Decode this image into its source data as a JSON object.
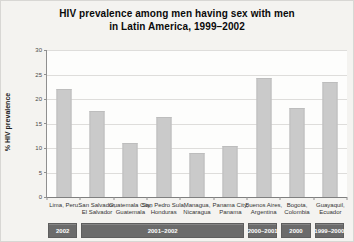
{
  "title": {
    "line1": "HIV prevalence among men having sex with men",
    "line2": "in Latin America, 1999–2002"
  },
  "chart_data": {
    "type": "bar",
    "title": "HIV prevalence among men having sex with men in Latin America, 1999–2002",
    "xlabel": "",
    "ylabel": "% HIV prevalence",
    "ylim": [
      0,
      30
    ],
    "yticks": [
      0,
      5,
      10,
      15,
      20,
      25,
      30
    ],
    "grid": true,
    "legend": "none",
    "categories": [
      "Lima, Peru",
      "San Salvador, El Salvador",
      "Guatemala City, Guatemala",
      "San Pedro Sula, Honduras",
      "Managua, Nicaragua",
      "Panama City, Panama",
      "Buenos Aires, Argentina",
      "Bogota, Colombia",
      "Guayaquil, Ecuador"
    ],
    "tick_label_lines": [
      [
        "Lima, Peru"
      ],
      [
        "San Salvador,",
        "El Salvador"
      ],
      [
        "Guatemala City,",
        "Guatemala"
      ],
      [
        "San Pedro Sula,",
        "Honduras"
      ],
      [
        "Managua,",
        "Nicaragua"
      ],
      [
        "Panama City,",
        "Panama"
      ],
      [
        "Buenos Aires,",
        "Argentina"
      ],
      [
        "Bogota,",
        "Colombia"
      ],
      [
        "Guayaquil,",
        "Ecuador"
      ]
    ],
    "values": [
      22.0,
      17.5,
      11.0,
      16.3,
      9.0,
      10.5,
      24.2,
      18.2,
      23.5
    ],
    "survey_periods": [
      {
        "label": "2002",
        "from": 0,
        "to": 0
      },
      {
        "label": "2001–2002",
        "from": 1,
        "to": 5
      },
      {
        "label": "2000–2001",
        "from": 6,
        "to": 6
      },
      {
        "label": "2000",
        "from": 7,
        "to": 7
      },
      {
        "label": "1999–2000",
        "from": 8,
        "to": 8
      }
    ]
  },
  "colors": {
    "page_bg": "#f4f3f0",
    "plot_bg": "#fdfdfc",
    "bar_fill": "#cacaca",
    "bar_border": "#bdbdbd",
    "gridline": "#dedddb",
    "axis": "#8f8f8f",
    "period_band_bg": "#6b6b6b",
    "period_band_text": "#ffffff",
    "title_text": "#0a0a0a",
    "tick_text": "#4a4a4a"
  }
}
